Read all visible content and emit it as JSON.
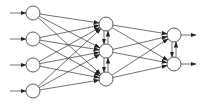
{
  "diagram": {
    "type": "neural-network",
    "colors": {
      "stroke": "#333333",
      "node_fill": "#ffffff",
      "background": "#ffffff"
    },
    "node_radius": 7,
    "layers": [
      {
        "name": "input",
        "x": 33,
        "ys": [
          13,
          39,
          65,
          91
        ]
      },
      {
        "name": "hidden",
        "x": 106,
        "ys": [
          24,
          51,
          79
        ]
      },
      {
        "name": "output",
        "x": 174,
        "ys": [
          35,
          64
        ]
      }
    ],
    "input_arrow_start_x": 10,
    "output_arrow_end_x": 196,
    "lateral_connections": [
      "hidden",
      "output"
    ]
  }
}
